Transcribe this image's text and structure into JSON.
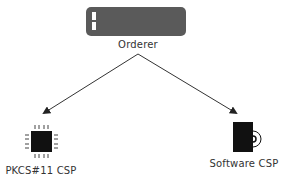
{
  "diagram": {
    "nodes": [
      {
        "id": "orderer",
        "label": "Orderer",
        "icon": "server-rack-icon"
      },
      {
        "id": "pkcs11",
        "label": "PKCS#11 CSP",
        "icon": "hardware-chip-icon"
      },
      {
        "id": "software",
        "label": "Software CSP",
        "icon": "software-package-disc-icon"
      }
    ],
    "edges": [
      {
        "from": "orderer",
        "to": "pkcs11",
        "style": "arrow"
      },
      {
        "from": "orderer",
        "to": "software",
        "style": "arrow"
      }
    ]
  },
  "colors": {
    "server_box": "#5a5a5a",
    "server_indicator": "#ffffff",
    "icon_fill": "#111111",
    "edge": "#333333",
    "text": "#333333"
  }
}
